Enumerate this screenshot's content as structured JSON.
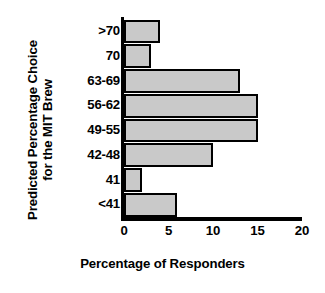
{
  "chart_data": {
    "type": "bar",
    "orientation": "horizontal",
    "title": "",
    "xlabel": "Percentage of Responders",
    "ylabel": "Predicted Percentage Choice for the MIT Brew",
    "ylabel_lines": [
      "Predicted Percentage Choice",
      "for the MIT Brew"
    ],
    "categories": [
      ">70",
      "70",
      "63-69",
      "56-62",
      "49-55",
      "42-48",
      "41",
      "<41"
    ],
    "values": [
      4,
      3,
      13,
      15,
      15,
      10,
      2,
      6
    ],
    "xlim": [
      0,
      20
    ],
    "xticks": [
      0,
      5,
      10,
      15,
      20
    ],
    "xtick_labels": [
      "0",
      "5",
      "10",
      "15",
      "20"
    ],
    "grid": false,
    "legend": false,
    "bar_fill_color": "#c9c9c9",
    "bar_edge_color": "#000000",
    "background_color": "#ffffff"
  }
}
